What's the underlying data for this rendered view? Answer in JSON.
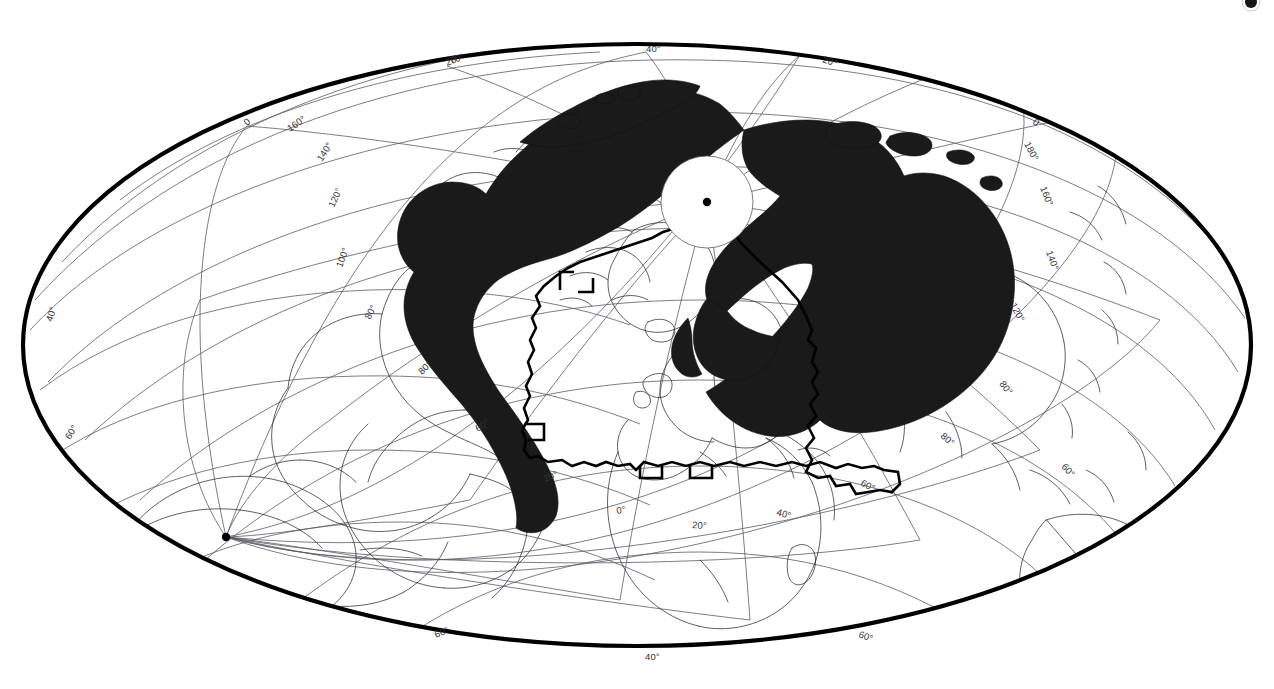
{
  "figure": {
    "name": "world-map-mollweide-north-polar",
    "projection": "Mollweide oblique (north-pole centred)",
    "background_color": "#ffffff",
    "frame_color": "#000000",
    "graticule_color": "#5a5a66",
    "coastline_color": "#1b1b22",
    "shaded_range_color": "#1a1a1a",
    "study_boundary_color": "#000000",
    "width": 1274,
    "height": 689
  },
  "poles": [
    {
      "name": "north-pole-marker",
      "label": "",
      "cx": 707,
      "cy": 202
    },
    {
      "name": "south-pole-marker",
      "label": "",
      "cx": 226,
      "cy": 537
    }
  ],
  "graticule_labels": {
    "top_edge": [
      {
        "text": "20°",
        "x": 447,
        "y": 66
      },
      {
        "text": "40°",
        "x": 646,
        "y": 52
      },
      {
        "text": "20°",
        "x": 822,
        "y": 62
      }
    ],
    "upper_left": [
      {
        "text": "0",
        "x": 247,
        "y": 126
      },
      {
        "text": "160°",
        "x": 292,
        "y": 131
      },
      {
        "text": "140°",
        "x": 325,
        "y": 160
      },
      {
        "text": "120°",
        "x": 337,
        "y": 207
      },
      {
        "text": "100°",
        "x": 344,
        "y": 266
      },
      {
        "text": "80°",
        "x": 372,
        "y": 317
      },
      {
        "text": "70°",
        "x": 448,
        "y": 66
      }
    ],
    "upper_right": [
      {
        "text": "0",
        "x": 1032,
        "y": 123
      },
      {
        "text": "180°",
        "x": 1026,
        "y": 142
      },
      {
        "text": "160°",
        "x": 1043,
        "y": 185
      },
      {
        "text": "140°",
        "x": 1050,
        "y": 250
      },
      {
        "text": "120°",
        "x": 1012,
        "y": 303
      },
      {
        "text": "100°",
        "x": 1000,
        "y": 382
      }
    ],
    "left_edge": [
      {
        "text": "40°",
        "x": 52,
        "y": 322
      },
      {
        "text": "60°",
        "x": 70,
        "y": 440
      }
    ],
    "right_edge": [
      {
        "text": "80°",
        "x": 1001,
        "y": 382
      },
      {
        "text": "60°",
        "x": 1063,
        "y": 465
      }
    ],
    "interior": [
      {
        "text": "80°",
        "x": 422,
        "y": 375
      },
      {
        "text": "60°",
        "x": 478,
        "y": 432
      },
      {
        "text": "20°",
        "x": 545,
        "y": 482
      },
      {
        "text": "0°",
        "x": 617,
        "y": 514
      },
      {
        "text": "20°",
        "x": 692,
        "y": 528
      },
      {
        "text": "40°",
        "x": 776,
        "y": 515
      },
      {
        "text": "60°",
        "x": 860,
        "y": 485
      },
      {
        "text": "80°",
        "x": 940,
        "y": 437
      }
    ],
    "bottom_edge": [
      {
        "text": "60°",
        "x": 436,
        "y": 638
      },
      {
        "text": "40°",
        "x": 645,
        "y": 660
      },
      {
        "text": "60°",
        "x": 858,
        "y": 637
      }
    ]
  },
  "legend": {
    "shaded_area_meaning": "",
    "boundary_meaning": ""
  },
  "annotations": {
    "corner_mark": {
      "name": "page-corner-mark",
      "x": 1248,
      "y": 3
    }
  }
}
